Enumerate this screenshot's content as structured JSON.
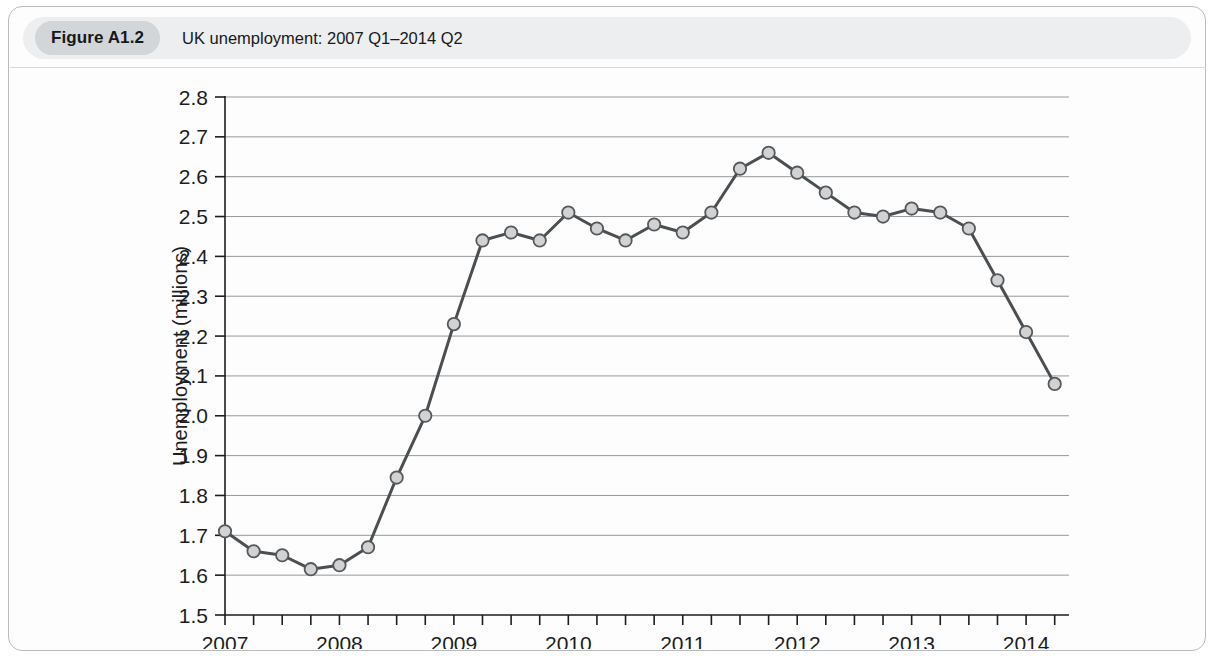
{
  "figure": {
    "badge_label": "Figure A1.2",
    "title": "UK unemployment: 2007 Q1–2014 Q2"
  },
  "chart_data": {
    "type": "line",
    "title": "UK unemployment: 2007 Q1–2014 Q2",
    "xlabel": "",
    "ylabel": "Unemployment (millions)",
    "xlim": [
      2007.0,
      2014.375
    ],
    "ylim": [
      1.5,
      2.8
    ],
    "y_ticks": [
      "1.5",
      "1.6",
      "1.7",
      "1.8",
      "1.9",
      "2.0",
      "2.1",
      "2.2",
      "2.3",
      "2.4",
      "2.5",
      "2.6",
      "2.7",
      "2.8"
    ],
    "y_tick_values": [
      1.5,
      1.6,
      1.7,
      1.8,
      1.9,
      2.0,
      2.1,
      2.2,
      2.3,
      2.4,
      2.5,
      2.6,
      2.7,
      2.8
    ],
    "x_ticks": [
      "2007",
      "2008",
      "2009",
      "2010",
      "2011",
      "2012",
      "2013",
      "2014"
    ],
    "x_tick_values": [
      2007,
      2008,
      2009,
      2010,
      2011,
      2012,
      2013,
      2014
    ],
    "x_minor_ticks_per_year": 4,
    "grid": "horizontal",
    "legend": "none",
    "marker": "circle",
    "quarters": [
      "2007 Q1",
      "2007 Q2",
      "2007 Q3",
      "2007 Q4",
      "2008 Q1",
      "2008 Q2",
      "2008 Q3",
      "2008 Q4",
      "2009 Q1",
      "2009 Q2",
      "2009 Q3",
      "2009 Q4",
      "2010 Q1",
      "2010 Q2",
      "2010 Q3",
      "2010 Q4",
      "2011 Q1",
      "2011 Q2",
      "2011 Q3",
      "2011 Q4",
      "2012 Q1",
      "2012 Q2",
      "2012 Q3",
      "2012 Q4",
      "2013 Q1",
      "2013 Q2",
      "2013 Q3",
      "2013 Q4",
      "2014 Q1",
      "2014 Q2"
    ],
    "x": [
      2007.0,
      2007.25,
      2007.5,
      2007.75,
      2008.0,
      2008.25,
      2008.5,
      2008.75,
      2009.0,
      2009.25,
      2009.5,
      2009.75,
      2010.0,
      2010.25,
      2010.5,
      2010.75,
      2011.0,
      2011.25,
      2011.5,
      2011.75,
      2012.0,
      2012.25,
      2012.5,
      2012.75,
      2013.0,
      2013.25,
      2013.5,
      2013.75,
      2014.0,
      2014.25
    ],
    "values": [
      1.71,
      1.66,
      1.65,
      1.615,
      1.625,
      1.67,
      1.845,
      2.0,
      2.23,
      2.44,
      2.46,
      2.44,
      2.51,
      2.47,
      2.44,
      2.48,
      2.46,
      2.51,
      2.62,
      2.66,
      2.61,
      2.56,
      2.51,
      2.5,
      2.52,
      2.51,
      2.47,
      2.34,
      2.21,
      2.08
    ],
    "series": [
      {
        "name": "UK unemployment",
        "values": [
          1.71,
          1.66,
          1.65,
          1.615,
          1.625,
          1.67,
          1.845,
          2.0,
          2.23,
          2.44,
          2.46,
          2.44,
          2.51,
          2.47,
          2.44,
          2.48,
          2.46,
          2.51,
          2.62,
          2.66,
          2.61,
          2.56,
          2.51,
          2.5,
          2.52,
          2.51,
          2.47,
          2.34,
          2.21,
          2.08
        ]
      }
    ],
    "colors": {
      "line": "#4b4f52",
      "marker_fill": "#d0d2d4",
      "marker_stroke": "#55595c",
      "grid": "#6f7376",
      "axis": "#1b1d1f"
    }
  }
}
